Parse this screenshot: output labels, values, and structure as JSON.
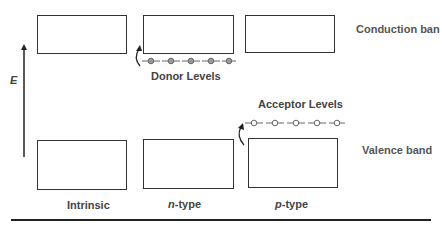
{
  "diagram": {
    "axis_label": "E",
    "band_labels": {
      "conduction": "Conduction ban",
      "valence": "Valence band"
    },
    "columns": [
      {
        "prefix": "",
        "name": "Intrinsic"
      },
      {
        "prefix": "n",
        "name": "-type"
      },
      {
        "prefix": "p",
        "name": "-type"
      }
    ],
    "level_labels": {
      "donor": "Donor Levels",
      "acceptor": "Acceptor Levels"
    },
    "donor_count": 5,
    "acceptor_count": 5,
    "colors": {
      "outline": "#333333",
      "donor_fill": "#9a9a9a",
      "text": "#444444"
    }
  }
}
